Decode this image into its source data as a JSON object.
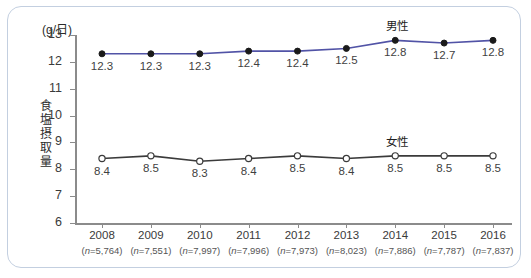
{
  "chart_data": {
    "type": "line",
    "title": "",
    "unit_label": "(g/日)",
    "ylabel": "食塩摂取量",
    "xlabel": "",
    "ylim": [
      6,
      13
    ],
    "yticks": [
      6,
      7,
      8,
      9,
      10,
      11,
      12,
      13
    ],
    "grid": false,
    "legend_position": "inline-above-series",
    "categories": [
      "2008",
      "2009",
      "2010",
      "2011",
      "2012",
      "2013",
      "2014",
      "2015",
      "2016"
    ],
    "sample_sizes": [
      "(n=5,764)",
      "(n=7,551)",
      "(n=7,997)",
      "(n=7,996)",
      "(n=7,973)",
      "(n=8,023)",
      "(n=7,886)",
      "(n=7,787)",
      "(n=7,837)"
    ],
    "series": [
      {
        "name": "男性",
        "color": "#5153a6",
        "marker": "filled-circle",
        "marker_color": "#1a1a1a",
        "values": [
          12.3,
          12.3,
          12.3,
          12.4,
          12.4,
          12.5,
          12.8,
          12.7,
          12.8
        ],
        "labels": [
          "12.3",
          "12.3",
          "12.3",
          "12.4",
          "12.4",
          "12.5",
          "12.8",
          "12.7",
          "12.8"
        ],
        "label_anchor_index": 6
      },
      {
        "name": "女性",
        "color": "#3b3b3b",
        "marker": "open-circle",
        "marker_color": "#ffffff",
        "values": [
          8.4,
          8.5,
          8.3,
          8.4,
          8.5,
          8.4,
          8.5,
          8.5,
          8.5
        ],
        "labels": [
          "8.4",
          "8.5",
          "8.3",
          "8.4",
          "8.5",
          "8.4",
          "8.5",
          "8.5",
          "8.5"
        ],
        "label_anchor_index": 6
      }
    ]
  },
  "colors": {
    "panel_border": "#c3cfe0",
    "axis": "#8b8b8b",
    "male_line": "#5153a6",
    "female_line": "#3b3b3b"
  }
}
